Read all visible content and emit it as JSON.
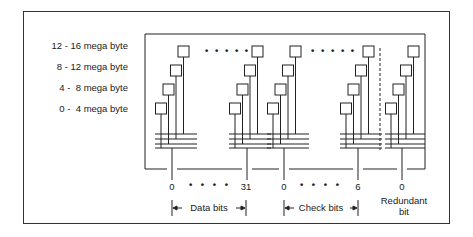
{
  "diagram": {
    "title": "",
    "row_labels": [
      "12 - 16 mega byte",
      "8 - 12 mega byte",
      "4 -  8 mega byte",
      "0 -  4 mega byte"
    ],
    "stacks": [
      {
        "group": "data",
        "bit": "0"
      },
      {
        "group": "data",
        "bit": "31"
      },
      {
        "group": "check",
        "bit": "0"
      },
      {
        "group": "check",
        "bit": "6"
      },
      {
        "group": "redundant",
        "bit": "0"
      }
    ],
    "ellipsis": "• • • • •",
    "bit_ellipsis": "• • • •",
    "bit_numbers": {
      "data_start": "0",
      "data_end": "31",
      "check_start": "0",
      "check_end": "6",
      "redundant": "0"
    },
    "groups": {
      "data": "Data bits",
      "check": "Check bits",
      "redundant_line1": "Redundant",
      "redundant_line2": "bit"
    }
  }
}
